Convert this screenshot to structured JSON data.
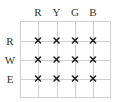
{
  "diagram": {
    "columns": [
      "R",
      "Y",
      "G",
      "B"
    ],
    "rows": [
      "R",
      "W",
      "E"
    ],
    "cells": [
      [
        true,
        true,
        true,
        true
      ],
      [
        true,
        true,
        true,
        true
      ],
      [
        true,
        true,
        true,
        true
      ]
    ],
    "mark_symbol": "x-mark-icon",
    "colors": {
      "grid": "#cfcfcf",
      "mark": "#222222",
      "label": "#333333"
    }
  }
}
